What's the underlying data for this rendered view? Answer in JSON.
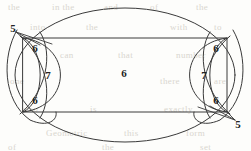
{
  "figure": {
    "stroke_color": "#3a3a3a",
    "background_color": "#fdfdfb",
    "label_color": "#232323",
    "ghost_color": "#d9d6cf",
    "width": 251,
    "height": 151
  },
  "shapes": {
    "ellipse": {
      "name": "large-ellipse",
      "cx": 125,
      "cy": 75,
      "rx": 110,
      "ry": 67
    },
    "rectangle": {
      "name": "inner-rectangle",
      "x": 23,
      "y": 38,
      "width": 204,
      "height": 74
    },
    "left_lens": {
      "name": "left-lens",
      "cx": 44,
      "cy": 75
    },
    "right_lens": {
      "name": "right-lens",
      "cx": 206,
      "cy": 75
    }
  },
  "labels": {
    "center": {
      "text": "6",
      "x": 124,
      "y": 73
    },
    "left_top": {
      "text": "6",
      "x": 35,
      "y": 48
    },
    "left_middle": {
      "text": "7",
      "x": 48,
      "y": 75
    },
    "left_bottom": {
      "text": "6",
      "x": 35,
      "y": 100
    },
    "right_top": {
      "text": "6",
      "x": 216,
      "y": 48
    },
    "right_middle": {
      "text": "7",
      "x": 204,
      "y": 75
    },
    "right_bottom": {
      "text": "6",
      "x": 216,
      "y": 100
    },
    "corner_top_left": {
      "text": "5",
      "x": 13,
      "y": 28
    },
    "corner_bottom_right": {
      "text": "5",
      "x": 238,
      "y": 124
    }
  },
  "background_text": [
    {
      "text": "the",
      "x": 8,
      "y": 2
    },
    {
      "text": "in the",
      "x": 52,
      "y": 2
    },
    {
      "text": "and",
      "x": 104,
      "y": 2
    },
    {
      "text": "of",
      "x": 150,
      "y": 2
    },
    {
      "text": "the",
      "x": 196,
      "y": 2
    },
    {
      "text": "into",
      "x": 30,
      "y": 22
    },
    {
      "text": "the",
      "x": 86,
      "y": 22
    },
    {
      "text": "with",
      "x": 170,
      "y": 22
    },
    {
      "text": "to",
      "x": 214,
      "y": 22
    },
    {
      "text": "can",
      "x": 60,
      "y": 50
    },
    {
      "text": "that",
      "x": 118,
      "y": 50
    },
    {
      "text": "number",
      "x": 176,
      "y": 50
    },
    {
      "text": "one",
      "x": 10,
      "y": 76
    },
    {
      "text": "there",
      "x": 160,
      "y": 76
    },
    {
      "text": "are",
      "x": 214,
      "y": 76
    },
    {
      "text": "also",
      "x": 22,
      "y": 104
    },
    {
      "text": "is",
      "x": 90,
      "y": 104
    },
    {
      "text": "exactly",
      "x": 164,
      "y": 104
    },
    {
      "text": "Geometric",
      "x": 46,
      "y": 128
    },
    {
      "text": "this",
      "x": 124,
      "y": 128
    },
    {
      "text": "form",
      "x": 186,
      "y": 128
    },
    {
      "text": "of",
      "x": 8,
      "y": 142
    },
    {
      "text": "the",
      "x": 102,
      "y": 142
    },
    {
      "text": "set",
      "x": 200,
      "y": 142
    }
  ]
}
